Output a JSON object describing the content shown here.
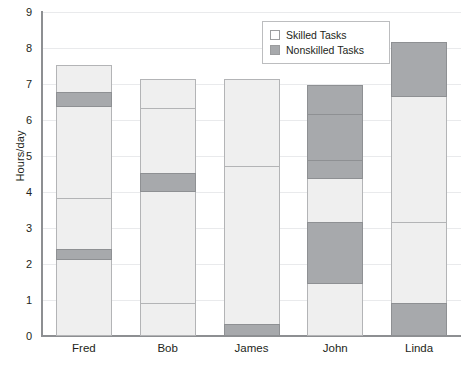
{
  "chart_data": {
    "type": "bar",
    "stacked": true,
    "title": "",
    "xlabel": "",
    "ylabel": "Hours/day",
    "ylim": [
      0,
      9
    ],
    "ytick_step": 1,
    "yticks": [
      "9",
      "8",
      "7",
      "6",
      "5",
      "4",
      "3",
      "2",
      "1",
      "0"
    ],
    "grid": true,
    "legend_position": "top-right",
    "legend": [
      {
        "key": "skilled",
        "label": "Skilled Tasks",
        "color": "#efefef"
      },
      {
        "key": "nonskilled",
        "label": "Nonskilled Tasks",
        "color": "#a7a9ac"
      }
    ],
    "categories": [
      "Fred",
      "Bob",
      "James",
      "John",
      "Linda"
    ],
    "totals": [
      7.5,
      7.1,
      7.1,
      6.95,
      8.15
    ],
    "bars": [
      {
        "category": "Fred",
        "total": 7.5,
        "segments": [
          {
            "type": "skilled",
            "from": 0.0,
            "to": 2.1,
            "value": 2.1
          },
          {
            "type": "nonskilled",
            "from": 2.1,
            "to": 2.4,
            "value": 0.3
          },
          {
            "type": "skilled",
            "from": 2.4,
            "to": 3.8,
            "value": 1.4
          },
          {
            "type": "skilled",
            "from": 3.8,
            "to": 6.35,
            "value": 2.55
          },
          {
            "type": "nonskilled",
            "from": 6.35,
            "to": 6.75,
            "value": 0.4
          },
          {
            "type": "skilled",
            "from": 6.75,
            "to": 7.5,
            "value": 0.75
          }
        ]
      },
      {
        "category": "Bob",
        "total": 7.1,
        "segments": [
          {
            "type": "skilled",
            "from": 0.0,
            "to": 0.9,
            "value": 0.9
          },
          {
            "type": "skilled",
            "from": 0.9,
            "to": 4.0,
            "value": 3.1
          },
          {
            "type": "nonskilled",
            "from": 4.0,
            "to": 4.5,
            "value": 0.5
          },
          {
            "type": "skilled",
            "from": 4.5,
            "to": 6.3,
            "value": 1.8
          },
          {
            "type": "skilled",
            "from": 6.3,
            "to": 7.1,
            "value": 0.8
          }
        ]
      },
      {
        "category": "James",
        "total": 7.1,
        "segments": [
          {
            "type": "nonskilled",
            "from": 0.0,
            "to": 0.3,
            "value": 0.3
          },
          {
            "type": "skilled",
            "from": 0.3,
            "to": 4.7,
            "value": 4.4
          },
          {
            "type": "skilled",
            "from": 4.7,
            "to": 7.1,
            "value": 2.4
          }
        ]
      },
      {
        "category": "John",
        "total": 6.95,
        "segments": [
          {
            "type": "skilled",
            "from": 0.0,
            "to": 1.45,
            "value": 1.45
          },
          {
            "type": "nonskilled",
            "from": 1.45,
            "to": 3.15,
            "value": 1.7
          },
          {
            "type": "skilled",
            "from": 3.15,
            "to": 4.35,
            "value": 1.2
          },
          {
            "type": "nonskilled",
            "from": 4.35,
            "to": 4.85,
            "value": 0.5
          },
          {
            "type": "nonskilled",
            "from": 4.85,
            "to": 6.15,
            "value": 1.3
          },
          {
            "type": "nonskilled",
            "from": 6.15,
            "to": 6.95,
            "value": 0.8
          }
        ]
      },
      {
        "category": "Linda",
        "total": 8.15,
        "segments": [
          {
            "type": "nonskilled",
            "from": 0.0,
            "to": 0.9,
            "value": 0.9
          },
          {
            "type": "skilled",
            "from": 0.9,
            "to": 3.15,
            "value": 2.25
          },
          {
            "type": "skilled",
            "from": 3.15,
            "to": 6.65,
            "value": 3.5
          },
          {
            "type": "nonskilled",
            "from": 6.65,
            "to": 8.15,
            "value": 1.5
          }
        ]
      }
    ]
  }
}
